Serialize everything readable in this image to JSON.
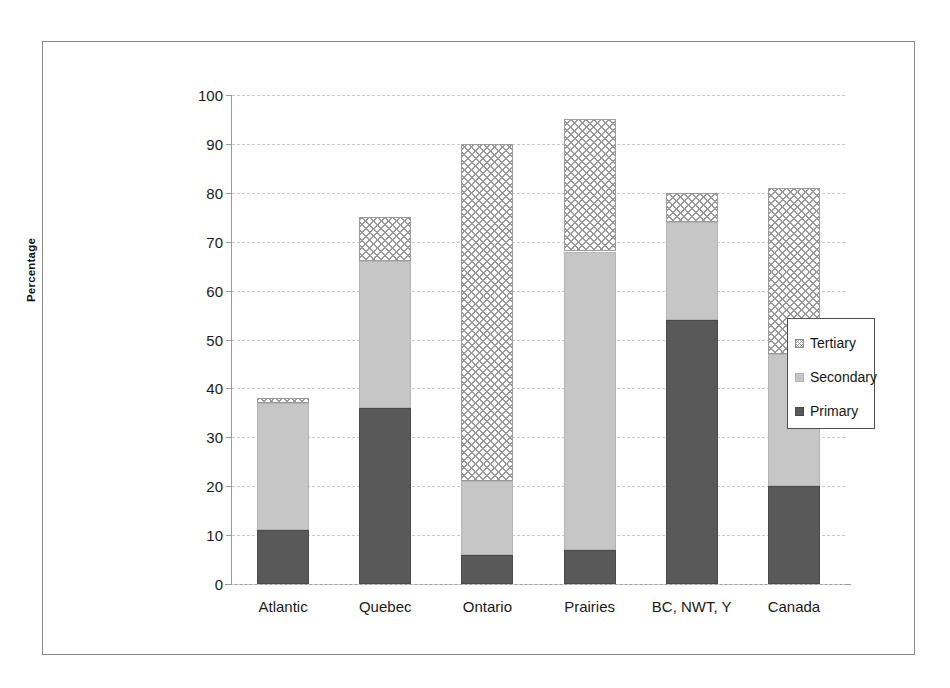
{
  "chart_data": {
    "type": "bar",
    "subtype": "stacked-vertical",
    "title": "",
    "xlabel": "",
    "ylabel": "Percentage",
    "ylim": [
      0,
      100
    ],
    "yticks": [
      0,
      10,
      20,
      30,
      40,
      50,
      60,
      70,
      80,
      90,
      100
    ],
    "ytick_labels": [
      "0",
      "10",
      "20",
      "30",
      "40",
      "50",
      "60",
      "70",
      "80",
      "90",
      "100"
    ],
    "grid": true,
    "grid_axis": "y",
    "grid_style": "dashed",
    "legend_position": "right",
    "categories": [
      "Atlantic",
      "Quebec",
      "Ontario",
      "Prairies",
      "BC, NWT, Y",
      "Canada"
    ],
    "series": [
      {
        "name": "Primary",
        "fill": "solid-dark-grey",
        "color": "#595959",
        "values": [
          11,
          36,
          6,
          7,
          54,
          20
        ]
      },
      {
        "name": "Secondary",
        "fill": "solid-light-grey",
        "color": "#c6c6c6",
        "values": [
          26,
          30,
          15,
          61,
          20,
          27
        ]
      },
      {
        "name": "Tertiary",
        "fill": "cross-hatch",
        "color": "#ffffff",
        "values": [
          1,
          9,
          69,
          27,
          6,
          34
        ]
      }
    ],
    "stack_tops": {
      "primary": [
        11,
        36,
        6,
        7,
        54,
        20
      ],
      "secondary": [
        37,
        66,
        21,
        68,
        74,
        47
      ],
      "total": [
        38,
        75,
        90,
        95,
        80,
        81
      ]
    }
  },
  "legend": {
    "items": [
      {
        "label": "Tertiary",
        "swatch": "cross-hatch-swatch"
      },
      {
        "label": "Secondary",
        "swatch": "light-grey-swatch"
      },
      {
        "label": "Primary",
        "swatch": "dark-grey-swatch"
      }
    ]
  },
  "axis": {
    "y_title": "Percentage"
  },
  "colors": {
    "primary": "#595959",
    "secondary": "#c6c6c6",
    "tertiary_line": "#9a9a9a",
    "axis": "#9a9a9a",
    "grid": "#c9c9c9",
    "frame": "#8a8a8a",
    "text": "#1a1a1a"
  }
}
